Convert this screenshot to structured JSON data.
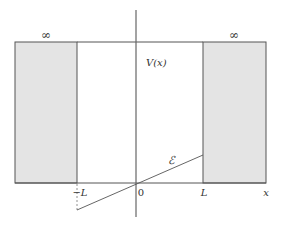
{
  "diagram": {
    "type": "potential-well",
    "labels": {
      "potential": "V(x)",
      "left_infinity": "∞",
      "right_infinity": "∞",
      "field": "ℰ",
      "x_axis": "x",
      "origin": "0",
      "left_edge": "−L",
      "right_edge": "L"
    },
    "colors": {
      "wall_fill": "#e4e4e4",
      "stroke": "#555555",
      "text": "#333333"
    },
    "geometry": {
      "left_wall": {
        "x1": 15,
        "x2": 77,
        "y_top": 42,
        "y_bottom": 183
      },
      "right_wall": {
        "x1": 203,
        "x2": 266,
        "y_top": 42,
        "y_bottom": 183
      },
      "vertical_axis": {
        "x": 136,
        "y1": 10,
        "y2": 217
      },
      "horizontal_axis": {
        "x1": 15,
        "x2": 266,
        "y": 183
      },
      "field_line": {
        "x1": 77,
        "y1": 210,
        "x2": 203,
        "y2": 155
      },
      "dashed_drop": {
        "x": 77,
        "y1": 183,
        "y2": 210
      }
    }
  }
}
